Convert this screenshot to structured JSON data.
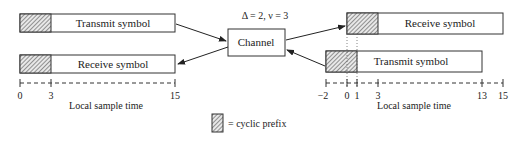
{
  "diagram": {
    "channel": {
      "label": "Channel",
      "params": "Δ = 2, ν = 3"
    },
    "left": {
      "transmit_label": "Transmit symbol",
      "receive_label": "Receive symbol",
      "axis_label": "Local sample time",
      "ticks": [
        "0",
        "3",
        "15"
      ]
    },
    "right": {
      "receive_label": "Receive symbol",
      "transmit_label": "Transmit symbol",
      "axis_label": "Local sample time",
      "ticks": [
        "−2",
        "0",
        "1",
        "3",
        "13",
        "15"
      ]
    },
    "legend": {
      "label": "= cyclic prefix"
    }
  }
}
